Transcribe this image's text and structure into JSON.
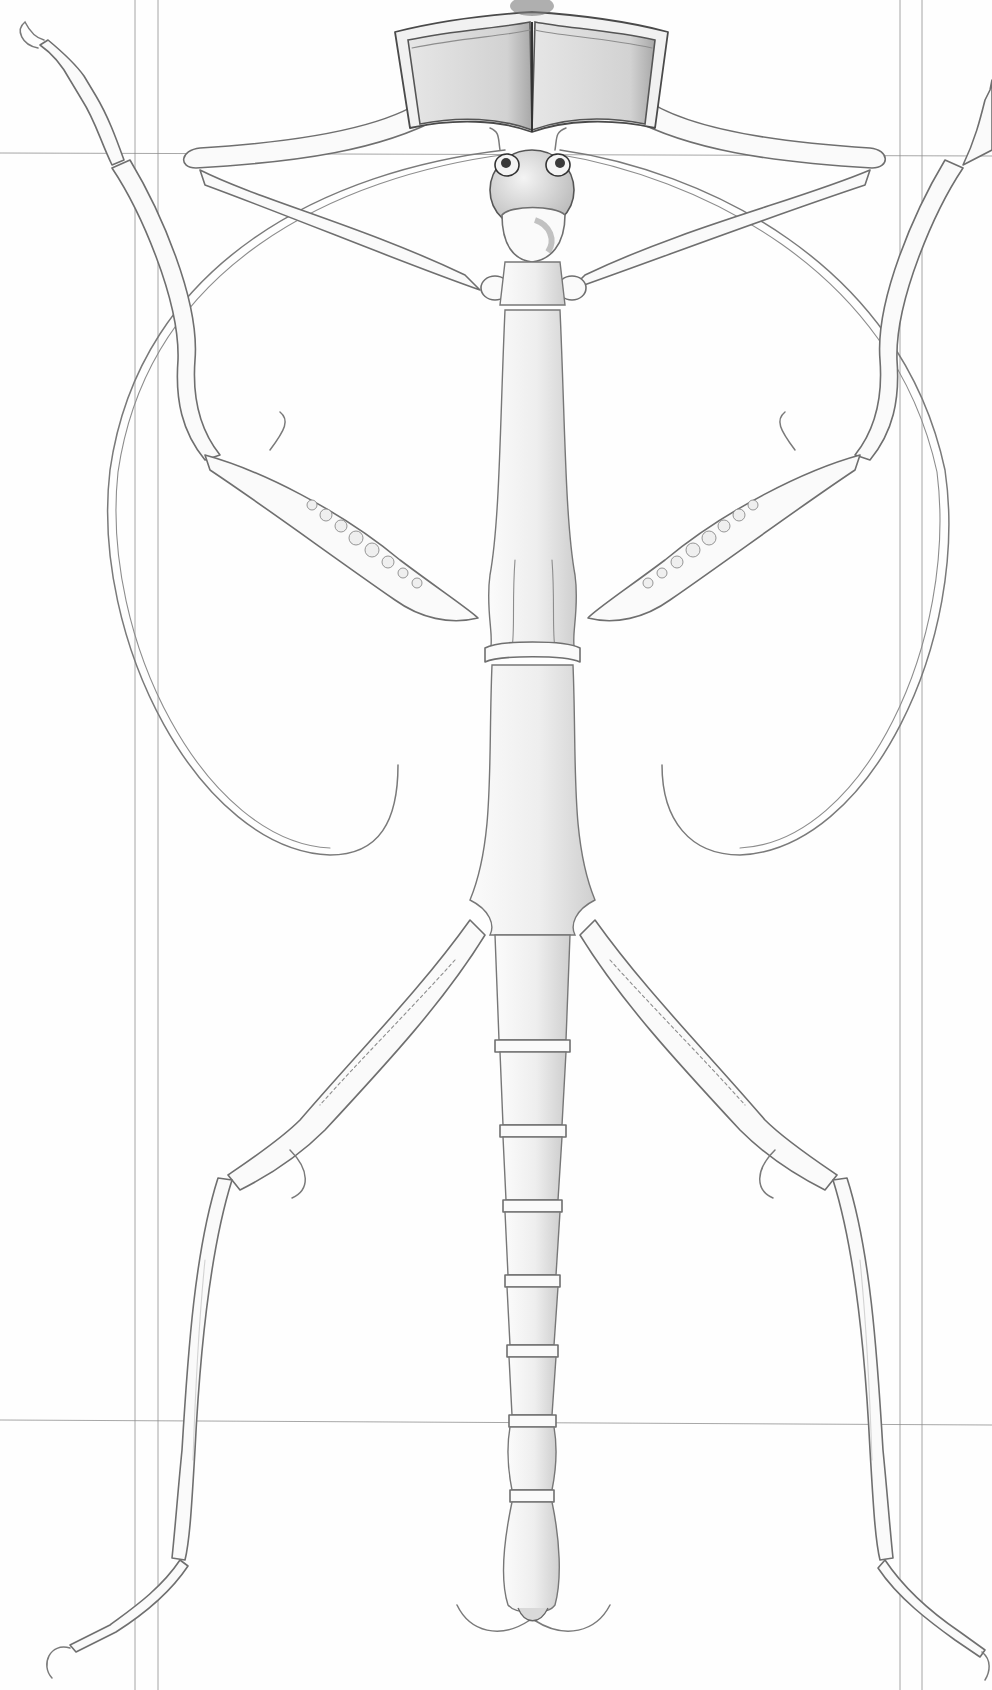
{
  "artwork": {
    "subject": "Pencil drawing of a stick insect (phasmid) holding an open book above its head",
    "medium": "graphite pencil on white paper",
    "elements": [
      "open-book",
      "head-with-eyes",
      "long-curling-antennae",
      "raptorial-forelegs-with-beaded-femora",
      "segmented-thorax",
      "segmented-abdomen",
      "hooked-cerci",
      "long-hind-legs-with-tarsal-claws",
      "construction-guide-lines"
    ]
  },
  "guides": {
    "vertical_x": [
      135,
      158,
      900,
      922
    ],
    "horizontal_y": [
      153,
      1422
    ]
  },
  "colors": {
    "paper": "#fefefe",
    "pencil_dark": "#3a3a3a",
    "pencil_mid": "#777777",
    "pencil_light": "#bdbdbd"
  }
}
